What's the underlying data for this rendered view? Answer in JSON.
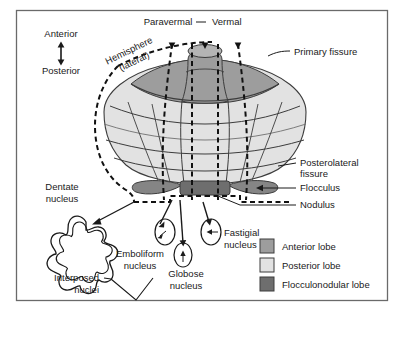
{
  "figure": {
    "frame_color": "#5a5a5a",
    "background": "#ffffff"
  },
  "orientation": {
    "anterior": "Anterior",
    "posterior": "Posterior",
    "arrow": "double-headed-vertical-arrow"
  },
  "zone_labels": {
    "hemisphere": "Hemisphere",
    "hemisphere_sub": "(lateral)",
    "paravermal": "Paravermal",
    "vermal": "Vermal"
  },
  "structure_labels": {
    "primary_fissure": "Primary fissure",
    "posterolateral_fissure_1": "Posterolateral",
    "posterolateral_fissure_2": "fissure",
    "flocculus": "Flocculus",
    "nodulus": "Nodulus"
  },
  "nuclei": {
    "dentate_1": "Dentate",
    "dentate_2": "nucleus",
    "emboliform_1": "Emboliform",
    "emboliform_2": "nucleus",
    "globose_1": "Globose",
    "globose_2": "nucleus",
    "fastigial_1": "Fastigial",
    "fastigial_2": "nucleus",
    "interposed_1": "Interposed",
    "interposed_2": "nuclei"
  },
  "legend": {
    "items": [
      {
        "label": "Anterior lobe",
        "color": "#9d9d9d"
      },
      {
        "label": "Posterior lobe",
        "color": "#e2e2e2"
      },
      {
        "label": "Flocculonodular lobe",
        "color": "#6e6e6e"
      }
    ]
  },
  "colors": {
    "anterior_lobe": "#9d9d9d",
    "posterior_lobe": "#e2e2e2",
    "flocculonodular_lobe": "#6e6e6e",
    "flocculus": "#858585",
    "outline": "#3c3c3c",
    "text": "#1a1a1a"
  }
}
